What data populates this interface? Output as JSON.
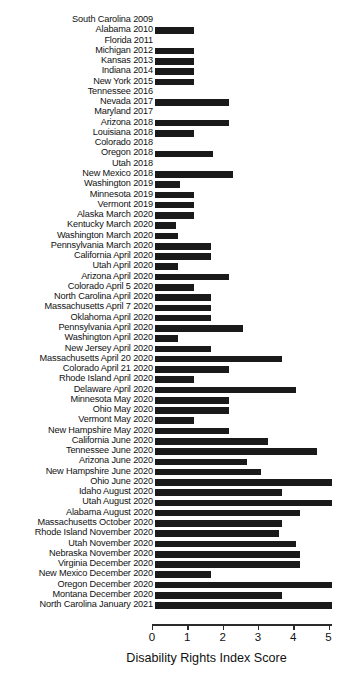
{
  "chart_data": {
    "type": "bar",
    "orientation": "horizontal",
    "title": "",
    "xlabel": "Disability Rights Index Score",
    "ylabel": "",
    "xlim": [
      0,
      5.07
    ],
    "xticks": [
      0,
      1,
      2,
      3,
      4,
      5
    ],
    "xticklabels": [
      "0",
      "1",
      "2",
      "3",
      "4",
      "5"
    ],
    "grid": false,
    "legend": null,
    "bar_color": "#1a1a1a",
    "categories": [
      "South Carolina 2009",
      "Alabama 2010",
      "Florida 2011",
      "Michigan 2012",
      "Kansas 2013",
      "Indiana 2014",
      "New York 2015",
      "Tennessee 2016",
      "Nevada 2017",
      "Maryland 2017",
      "Arizona 2018",
      "Louisiana 2018",
      "Colorado 2018",
      "Oregon 2018",
      "Utah 2018",
      "New Mexico 2018",
      "Washington 2019",
      "Minnesota 2019",
      "Vermont 2019",
      "Alaska March 2020",
      "Kentucky March 2020",
      "Washington March 2020",
      "Pennsylvania March 2020",
      "California April 2020",
      "Utah April 2020",
      "Arizona April 2020",
      "Colorado April 5 2020",
      "North Carolina April 2020",
      "Massachusetts April 7 2020",
      "Oklahoma April 2020",
      "Pennsylvania April 2020",
      "Washington April 2020",
      "New Jersey April 2020",
      "Massachusetts April 20 2020",
      "Colorado April 21 2020",
      "Rhode Island April 2020",
      "Delaware April 2020",
      "Minnesota May 2020",
      "Ohio May 2020",
      "Vermont May 2020",
      "New Hampshire May 2020",
      "California June 2020",
      "Tennessee June 2020",
      "Arizona June 2020",
      "New Hampshire June 2020",
      "Ohio June 2020",
      "Idaho August 2020",
      "Utah August 2020",
      "Alabama August 2020",
      "Massachusetts October 2020",
      "Rhode Island November 2020",
      "Utah November 2020",
      "Nebraska November 2020",
      "Virginia December 2020",
      "New Mexico December 2020",
      "Oregon December 2020",
      "Montana December 2020",
      "North Carolina January 2021"
    ],
    "values": [
      0,
      1.1,
      0,
      1.1,
      1.1,
      1.1,
      1.1,
      0,
      2.1,
      0,
      2.1,
      1.1,
      0,
      1.65,
      0,
      2.2,
      0.7,
      1.1,
      1.1,
      1.1,
      0.6,
      0.65,
      1.6,
      1.6,
      0.65,
      2.1,
      1.1,
      1.6,
      1.6,
      1.6,
      2.5,
      0.65,
      1.6,
      3.6,
      2.1,
      1.1,
      4.0,
      2.1,
      2.1,
      1.1,
      2.1,
      3.2,
      4.6,
      2.6,
      3.0,
      5.0,
      3.6,
      5.0,
      4.1,
      3.6,
      3.5,
      4.0,
      4.1,
      4.1,
      1.6,
      5.0,
      3.6,
      5.0
    ]
  }
}
